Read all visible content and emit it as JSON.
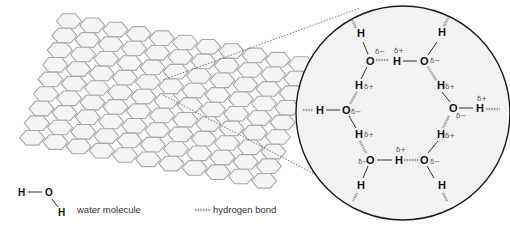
{
  "diagram": {
    "lattice": {
      "rows": 9,
      "cols": 11,
      "description": "hexagonal ice lattice (sheet)"
    },
    "zoom_view": {
      "molecules": [
        {
          "id": "o1",
          "oxygen_label": "O",
          "charge": "δ−"
        },
        {
          "id": "o2",
          "oxygen_label": "O",
          "charge": "δ−"
        },
        {
          "id": "o3",
          "oxygen_label": "O",
          "charge": "δ−"
        },
        {
          "id": "o4",
          "oxygen_label": "O",
          "charge": "δ−"
        },
        {
          "id": "o5",
          "oxygen_label": "O",
          "charge": "δ−"
        },
        {
          "id": "o6",
          "oxygen_label": "O",
          "charge": "δ−"
        }
      ],
      "hydrogen_label": "H",
      "partial_positive": "δ+",
      "partial_negative": "δ−"
    },
    "legend": {
      "water_molecule": {
        "h1": "H",
        "o": "O",
        "h2": "H",
        "label": "water molecule"
      },
      "hydrogen_bond": {
        "label": "hydrogen bond"
      }
    },
    "colors": {
      "hex_stroke": "#a8a8a8",
      "hex_fill": "#f4f4f4",
      "circle_fill": "#f2f2f2",
      "circle_stroke": "#1a1a1a",
      "bond": "#333333",
      "hbond": "#8a8a8a"
    }
  }
}
